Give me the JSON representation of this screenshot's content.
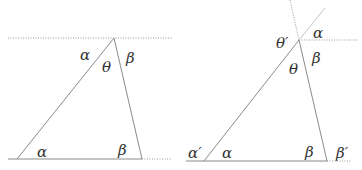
{
  "figure": {
    "left_panel": {
      "labels": {
        "alpha_top": "α",
        "theta": "θ",
        "beta_top": "β",
        "alpha_bottom": "α",
        "beta_bottom": "β"
      }
    },
    "right_panel": {
      "labels": {
        "theta_prime": "θ′",
        "alpha_top": "α",
        "theta": "θ",
        "beta_top": "β",
        "alpha_prime": "α′",
        "alpha_bottom": "α",
        "beta_bottom": "β",
        "beta_prime": "β′"
      }
    },
    "colors": {
      "line": "#8a8a8a",
      "dotted": "#9a9a9a",
      "text": "#333333"
    }
  }
}
